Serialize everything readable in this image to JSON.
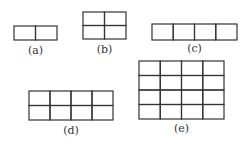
{
  "figures": [
    {
      "id": "a",
      "label": "(a)",
      "cols": 2,
      "rows": 1
    },
    {
      "id": "b",
      "label": "(b)",
      "cols": 2,
      "rows": 2
    },
    {
      "id": "c",
      "label": "(c)",
      "cols": 4,
      "rows": 1
    },
    {
      "id": "d",
      "label": "(d)",
      "cols": 4,
      "rows": 2
    },
    {
      "id": "e",
      "label": "(e)",
      "cols": 4,
      "rows": 4
    }
  ],
  "colors": {
    "stroke": "#333333",
    "text": "#333333"
  }
}
